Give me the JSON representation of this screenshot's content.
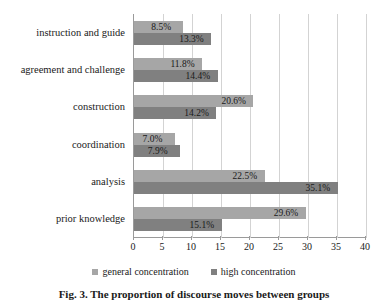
{
  "chart_data": {
    "type": "bar",
    "orientation": "horizontal",
    "title": "",
    "xlabel": "",
    "ylabel": "",
    "xlim": [
      0,
      40
    ],
    "xticks": [
      0,
      5,
      10,
      15,
      20,
      25,
      30,
      35,
      40
    ],
    "grid": true,
    "legend_position": "bottom",
    "categories": [
      "instruction and guide",
      "agreement and challenge",
      "construction",
      "coordination",
      "analysis",
      "prior knowledge"
    ],
    "series": [
      {
        "name": "general concentration",
        "color": "#a6a6a6",
        "values": [
          8.5,
          11.8,
          20.6,
          7.0,
          22.5,
          29.6
        ],
        "labels": [
          "8.5%",
          "11.8%",
          "20.6%",
          "7.0%",
          "22.5%",
          "29.6%"
        ]
      },
      {
        "name": "high concentration",
        "color": "#808080",
        "values": [
          13.3,
          14.4,
          14.2,
          7.9,
          35.1,
          15.1
        ],
        "labels": [
          "13.3%",
          "14.4%",
          "14.2%",
          "7.9%",
          "35.1%",
          "15.1%"
        ]
      }
    ]
  },
  "legend": {
    "items": [
      {
        "label": "general concentration",
        "color": "#a6a6a6"
      },
      {
        "label": "high concentration",
        "color": "#808080"
      }
    ]
  },
  "caption": {
    "text": "Fig. 3. The proportion of discourse moves between groups"
  }
}
